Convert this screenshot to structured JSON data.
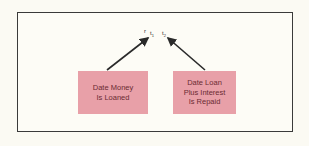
{
  "diagram": {
    "time_labels": {
      "prefix": "r",
      "t1": "t",
      "t1_sub": "1",
      "t2": "t",
      "t2_sub": "2"
    },
    "boxes": [
      {
        "label_lines": [
          "Date Money",
          "Is Loaned"
        ],
        "points_to": "t1"
      },
      {
        "label_lines": [
          "Date Loan",
          "Plus Interest",
          "Is Repaid"
        ],
        "points_to": "t2"
      }
    ],
    "colors": {
      "box_fill": "#e8a0a8",
      "box_text": "#6b2b33",
      "arrow": "#2a2a2a",
      "frame": "#3a3a3a"
    }
  }
}
